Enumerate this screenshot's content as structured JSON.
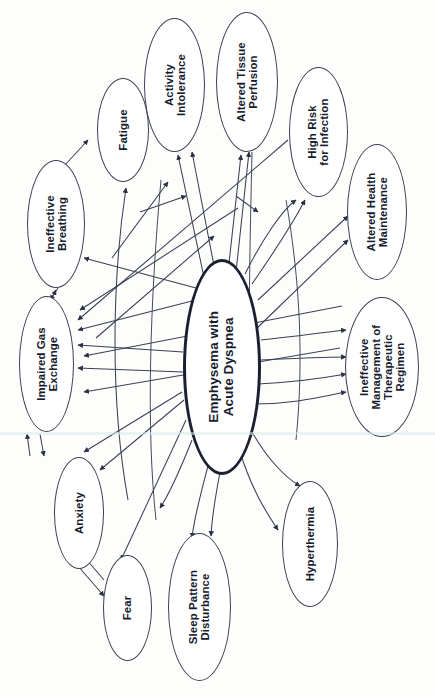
{
  "diagram": {
    "orientation": "rotated-90-ccw",
    "background_color": "#fdfdfb",
    "node_stroke_color": "#3b3f55",
    "central_stroke_color": "#1b1f33",
    "text_color": "#171b2e",
    "central": {
      "id": "central",
      "label": "Emphysema with\nAcute Dyspnea",
      "x": 183,
      "y": 259,
      "w": 78,
      "h": 216
    },
    "nodes": [
      {
        "id": "ineffective-breathing",
        "label": "Ineffective\nBreathing",
        "x": 27,
        "y": 160,
        "w": 58,
        "h": 128
      },
      {
        "id": "fatigue",
        "label": "Fatigue",
        "x": 97,
        "y": 78,
        "w": 52,
        "h": 104
      },
      {
        "id": "activity-intolerance",
        "label": "Activity\nIntolerance",
        "x": 144,
        "y": 18,
        "w": 61,
        "h": 134
      },
      {
        "id": "altered-tissue-perfusion",
        "label": "Altered Tissue\nPerfusion",
        "x": 216,
        "y": 12,
        "w": 62,
        "h": 140
      },
      {
        "id": "high-risk-for-infection",
        "label": "High Risk\nfor Infection",
        "x": 289,
        "y": 67,
        "w": 59,
        "h": 130
      },
      {
        "id": "altered-health-maintenance",
        "label": "Altered Health\nMaintenance",
        "x": 347,
        "y": 144,
        "w": 60,
        "h": 136
      },
      {
        "id": "ineffective-management",
        "label": "Ineffective\nManagement of\nTherapeutic\nRegimen",
        "x": 345,
        "y": 297,
        "w": 74,
        "h": 140
      },
      {
        "id": "hyperthermia",
        "label": "Hyperthermia",
        "x": 282,
        "y": 481,
        "w": 56,
        "h": 126
      },
      {
        "id": "sleep-pattern-disturbance",
        "label": "Sleep Pattern\nDisturbance",
        "x": 168,
        "y": 533,
        "w": 63,
        "h": 148
      },
      {
        "id": "fear",
        "label": "Fear",
        "x": 103,
        "y": 555,
        "w": 49,
        "h": 106
      },
      {
        "id": "anxiety",
        "label": "Anxiety",
        "x": 54,
        "y": 457,
        "w": 50,
        "h": 112
      },
      {
        "id": "impaired-gas-exchange",
        "label": "Impaired Gas\nExchange",
        "x": 19,
        "y": 296,
        "w": 55,
        "h": 136
      }
    ],
    "edges": [
      {
        "from": "central",
        "to": "impaired-gas-exchange",
        "style": "straight"
      },
      {
        "from": "central",
        "to": "impaired-gas-exchange",
        "style": "straight"
      },
      {
        "from": "central",
        "to": "ineffective-breathing",
        "style": "straight"
      },
      {
        "from": "central",
        "to": "activity-intolerance",
        "style": "straight"
      },
      {
        "from": "central",
        "to": "altered-tissue-perfusion",
        "style": "straight"
      },
      {
        "from": "central",
        "to": "high-risk-for-infection",
        "style": "straight"
      },
      {
        "from": "central",
        "to": "altered-health-maintenance",
        "style": "straight"
      },
      {
        "from": "central",
        "to": "ineffective-management",
        "style": "curve"
      },
      {
        "from": "central",
        "to": "hyperthermia",
        "style": "curve"
      },
      {
        "from": "central",
        "to": "sleep-pattern-disturbance",
        "style": "curve"
      },
      {
        "from": "central",
        "to": "fear",
        "style": "straight"
      },
      {
        "from": "central",
        "to": "anxiety",
        "style": "straight"
      },
      {
        "from": "impaired-gas-exchange",
        "to": "ineffective-breathing",
        "style": "bidirectional"
      },
      {
        "from": "impaired-gas-exchange",
        "to": "anxiety",
        "style": "bidirectional"
      },
      {
        "from": "anxiety",
        "to": "fear",
        "style": "bidirectional"
      },
      {
        "from": "ineffective-breathing",
        "to": "fatigue",
        "style": "straight"
      },
      {
        "from": "fatigue",
        "to": "activity-intolerance",
        "style": "curve"
      },
      {
        "from": "sleep-pattern-disturbance",
        "to": "fatigue",
        "style": "curve"
      },
      {
        "from": "high-risk-for-infection",
        "to": "impaired-gas-exchange",
        "style": "straight"
      },
      {
        "from": "altered-tissue-perfusion",
        "to": "impaired-gas-exchange",
        "style": "straight"
      }
    ]
  }
}
